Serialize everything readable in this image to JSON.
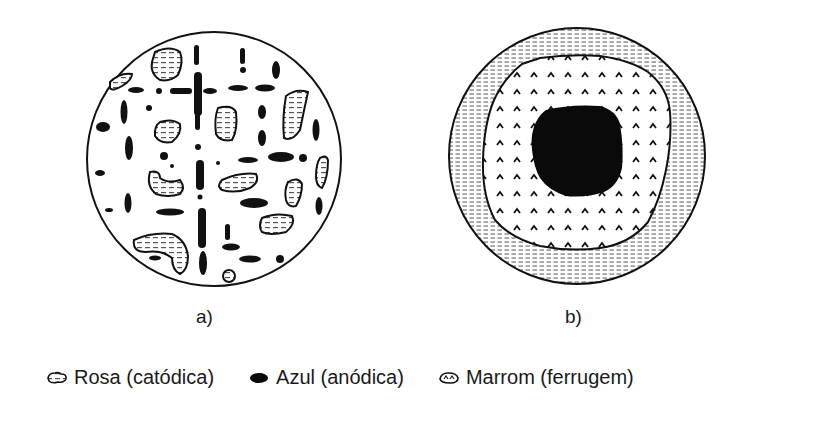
{
  "figure": {
    "panels": [
      {
        "id": "a",
        "label": "a)",
        "description": "Many small separated cathodic (pink) and anodic (blue) regions"
      },
      {
        "id": "b",
        "label": "b)",
        "description": "Central anodic (blue) region, surrounded by rust (brown) zone, outer cathodic (pink) ring"
      }
    ]
  },
  "legend": {
    "items": [
      {
        "icon": "pink-hatched-blob-icon",
        "label": "Rosa (catódica)"
      },
      {
        "icon": "blue-solid-blob-icon",
        "label": "Azul (anódica)"
      },
      {
        "icon": "brown-chevron-blob-icon",
        "label": "Marrom (ferrugem)"
      }
    ]
  },
  "colors": {
    "ink": "#111111",
    "background": "#ffffff",
    "hatch": "#555555"
  }
}
